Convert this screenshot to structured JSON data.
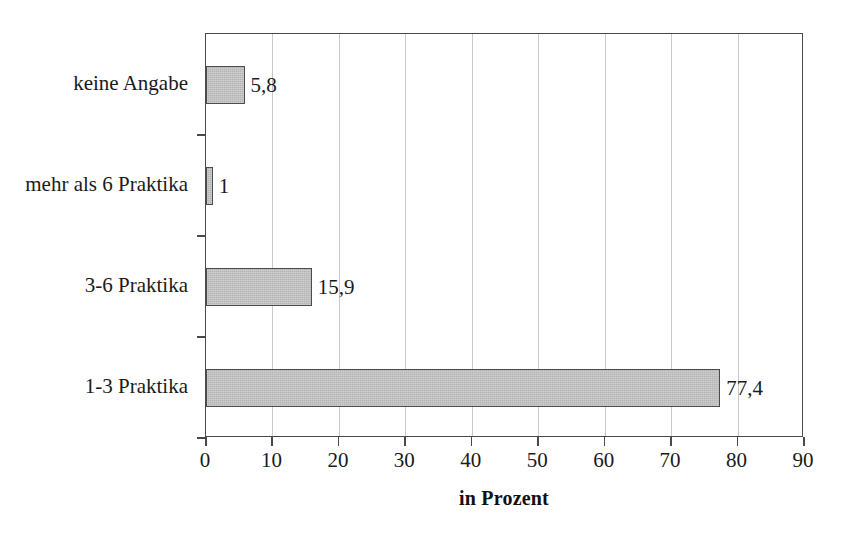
{
  "chart_data": {
    "type": "bar",
    "orientation": "horizontal",
    "title": "",
    "subtitle": "",
    "xlabel": "in Prozent",
    "ylabel": "",
    "categories": [
      "1-3 Praktika",
      "3-6 Praktika",
      "mehr als 6 Praktika",
      "keine Angabe"
    ],
    "values": [
      77.4,
      15.9,
      1,
      5.8
    ],
    "value_labels": [
      "77,4",
      "15,9",
      "1",
      "5,8"
    ],
    "xlim": [
      0,
      90
    ],
    "xticks": [
      0,
      10,
      20,
      30,
      40,
      50,
      60,
      70,
      80,
      90
    ],
    "xtick_labels": [
      "0",
      "10",
      "20",
      "30",
      "40",
      "50",
      "60",
      "70",
      "80",
      "90"
    ],
    "grid": "vertical",
    "legend": "none",
    "bar_fill_color": "#b4b4b4",
    "bar_border_color": "#4b4b4b",
    "gridline_color": "#c9c9c9",
    "axis_color": "#4a4a4a",
    "background_color": "#ffffff",
    "text_color": "#1a1a1a"
  },
  "rows": [
    {
      "label": "keine Angabe",
      "value": 5.8,
      "value_label": "5,8"
    },
    {
      "label": "mehr als 6 Praktika",
      "value": 1,
      "value_label": "1"
    },
    {
      "label": "3-6 Praktika",
      "value": 15.9,
      "value_label": "15,9"
    },
    {
      "label": "1-3 Praktika",
      "value": 77.4,
      "value_label": "77,4"
    }
  ],
  "axis": {
    "x_title": "in Prozent",
    "x_min": 0,
    "x_max": 90,
    "x_ticks": [
      "0",
      "10",
      "20",
      "30",
      "40",
      "50",
      "60",
      "70",
      "80",
      "90"
    ]
  }
}
